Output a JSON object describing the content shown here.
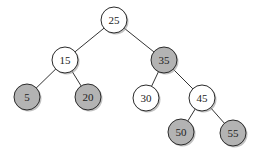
{
  "diagram": {
    "type": "binary-search-tree",
    "colors": {
      "plain_fill": "#ffffff",
      "shaded_fill": "#b3b3b3",
      "stroke": "#2a2a2a",
      "shadow": "#9a9a9a",
      "edge": "#333333"
    },
    "radius": 13,
    "nodes": [
      {
        "id": "n25",
        "label": "25",
        "x": 114,
        "y": 20,
        "shaded": false
      },
      {
        "id": "n15",
        "label": "15",
        "x": 65,
        "y": 60,
        "shaded": false
      },
      {
        "id": "n35",
        "label": "35",
        "x": 164,
        "y": 60,
        "shaded": true
      },
      {
        "id": "n5",
        "label": "5",
        "x": 27,
        "y": 97,
        "shaded": true
      },
      {
        "id": "n20",
        "label": "20",
        "x": 88,
        "y": 97,
        "shaded": true
      },
      {
        "id": "n30",
        "label": "30",
        "x": 146,
        "y": 98,
        "shaded": false
      },
      {
        "id": "n45",
        "label": "45",
        "x": 202,
        "y": 98,
        "shaded": false
      },
      {
        "id": "n50",
        "label": "50",
        "x": 181,
        "y": 132,
        "shaded": true
      },
      {
        "id": "n55",
        "label": "55",
        "x": 233,
        "y": 133,
        "shaded": true
      }
    ],
    "edges": [
      [
        "n25",
        "n15"
      ],
      [
        "n25",
        "n35"
      ],
      [
        "n15",
        "n5"
      ],
      [
        "n15",
        "n20"
      ],
      [
        "n35",
        "n30"
      ],
      [
        "n35",
        "n45"
      ],
      [
        "n45",
        "n50"
      ],
      [
        "n45",
        "n55"
      ]
    ]
  }
}
